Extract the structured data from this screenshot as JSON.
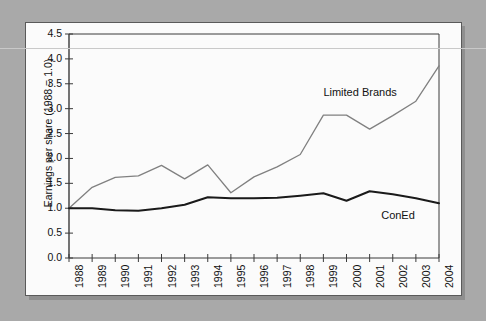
{
  "figure": {
    "background_color": "#a9a9a9",
    "panel_color": "#fbfbfb",
    "border_color": "#5a5a5a"
  },
  "chart_data": {
    "type": "line",
    "title": "",
    "xlabel": "",
    "ylabel": "Earnings per share (1988 = 1.0)",
    "x": [
      1988,
      1989,
      1990,
      1991,
      1992,
      1993,
      1994,
      1995,
      1996,
      1997,
      1998,
      1999,
      2000,
      2001,
      2002,
      2003,
      2004
    ],
    "categories": [
      "1988",
      "1989",
      "1990",
      "1991",
      "1992",
      "1993",
      "1994",
      "1995",
      "1996",
      "1997",
      "1998",
      "1999",
      "2000",
      "2001",
      "2002",
      "2003",
      "2004"
    ],
    "xlim": [
      1988,
      2004
    ],
    "ylim": [
      0.0,
      4.5
    ],
    "yticks": [
      "0.0",
      "0.5",
      "1.0",
      "1.5",
      "2.0",
      "2.5",
      "3.0",
      "3.5",
      "4.0",
      "4.5"
    ],
    "ytick_values": [
      0.0,
      0.5,
      1.0,
      1.5,
      2.0,
      2.5,
      3.0,
      3.5,
      4.0,
      4.5
    ],
    "grid": false,
    "legend_position": "inline-annotation",
    "series": [
      {
        "name": "Limited Brands",
        "color": "#808080",
        "values": [
          1.0,
          1.42,
          1.62,
          1.65,
          1.86,
          1.59,
          1.87,
          1.31,
          1.63,
          1.83,
          2.08,
          2.87,
          2.87,
          2.59,
          2.86,
          3.15,
          3.86
        ],
        "label_text": "Limited Brands"
      },
      {
        "name": "ConEd",
        "color": "#1a1a1a",
        "values": [
          1.0,
          1.0,
          0.96,
          0.95,
          1.0,
          1.07,
          1.22,
          1.2,
          1.2,
          1.21,
          1.25,
          1.3,
          1.15,
          1.34,
          1.28,
          1.2,
          1.1
        ],
        "label_text": "ConEd"
      }
    ],
    "annotations": [
      {
        "text": "Limited Brands",
        "x": 1999.0,
        "y": 3.3
      },
      {
        "text": "ConEd",
        "x": 2001.5,
        "y": 0.82
      }
    ]
  }
}
